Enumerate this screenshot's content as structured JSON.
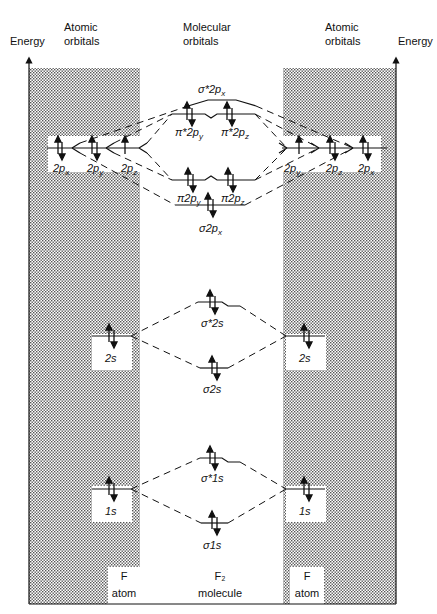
{
  "header": {
    "energy_left": "Energy",
    "atomic_left": [
      "Atomic",
      "orbitals"
    ],
    "molecular": [
      "Molecular",
      "orbitals"
    ],
    "atomic_right": [
      "Atomic",
      "orbitals"
    ],
    "energy_right": "Energy"
  },
  "left_atom": {
    "p_labels": [
      "2px",
      "2py",
      "2pz"
    ],
    "p_labels_display": {
      "x": "2p",
      "x_sub": "x",
      "y": "2p",
      "y_sub": "y",
      "z": "2p",
      "z_sub": "z"
    },
    "s2": "2s",
    "s1": "1s",
    "footer": [
      "F",
      "atom"
    ]
  },
  "right_atom": {
    "p_labels": [
      "2py",
      "2pz",
      "2px"
    ],
    "s2": "2s",
    "s1": "1s",
    "footer": [
      "F",
      "atom"
    ]
  },
  "molecule": {
    "orbitals": [
      {
        "id": "sigma_star_2px",
        "label": "σ*2p",
        "sub": "x",
        "electrons": 0
      },
      {
        "id": "pi_star_2py",
        "label": "π*2p",
        "sub": "y",
        "electrons": 2
      },
      {
        "id": "pi_star_2pz",
        "label": "π*2p",
        "sub": "z",
        "electrons": 2
      },
      {
        "id": "pi_2py",
        "label": "π2p",
        "sub": "y",
        "electrons": 2
      },
      {
        "id": "pi_2pz",
        "label": "π2p",
        "sub": "z",
        "electrons": 2
      },
      {
        "id": "sigma_2px",
        "label": "σ2p",
        "sub": "x",
        "electrons": 2
      },
      {
        "id": "sigma_star_2s",
        "label": "σ*2s",
        "sub": "",
        "electrons": 2
      },
      {
        "id": "sigma_2s",
        "label": "σ2s",
        "sub": "",
        "electrons": 2
      },
      {
        "id": "sigma_star_1s",
        "label": "σ*1s",
        "sub": "",
        "electrons": 2
      },
      {
        "id": "sigma_1s",
        "label": "σ1s",
        "sub": "",
        "electrons": 2
      }
    ],
    "footer": [
      "F₂",
      "molecule"
    ]
  },
  "colors": {
    "ink": "#111111",
    "stipple": "#9a9a9a",
    "background": "#ffffff"
  }
}
